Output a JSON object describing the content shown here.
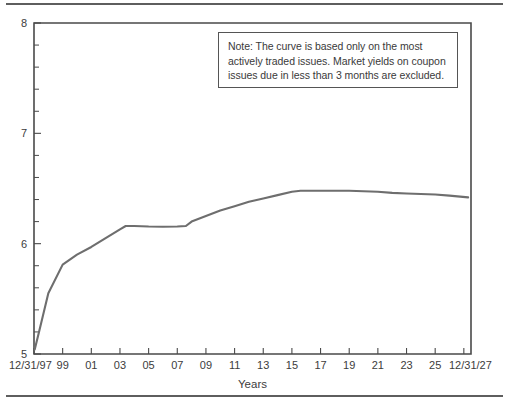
{
  "figure": {
    "note_text": "Note: The curve is based only on the most actively traded issues. Market yields on coupon issues due in less than 3 months are excluded."
  },
  "chart_data": {
    "type": "line",
    "title": "",
    "xlabel": "Years",
    "ylabel": "",
    "xlim": [
      1997,
      2027.5
    ],
    "ylim": [
      5,
      8
    ],
    "grid": false,
    "legend": null,
    "y_ticks": [
      5,
      6,
      7,
      8
    ],
    "y_tick_labels": [
      "5",
      "6",
      "7",
      "8"
    ],
    "y_minor_tick_step": 0.2,
    "x_ticks": [
      1997,
      1999,
      2001,
      2003,
      2005,
      2007,
      2009,
      2011,
      2013,
      2015,
      2017,
      2019,
      2021,
      2023,
      2025,
      2027
    ],
    "x_tick_labels": [
      "12/31/97",
      "99",
      "01",
      "03",
      "05",
      "07",
      "09",
      "11",
      "13",
      "15",
      "17",
      "19",
      "21",
      "23",
      "25",
      "12/31/27"
    ],
    "series": [
      {
        "name": "Treasury yield curve",
        "color": "#6e6e6e",
        "x": [
          1997.05,
          1997.35,
          1998.0,
          1999.0,
          2000.0,
          2001.0,
          2002.0,
          2003.0,
          2003.4,
          2004.0,
          2005.0,
          2006.0,
          2007.0,
          2007.6,
          2008.0,
          2009.0,
          2010.0,
          2011.0,
          2012.0,
          2013.0,
          2014.0,
          2015.0,
          2015.6,
          2016.0,
          2017.0,
          2018.0,
          2019.0,
          2020.0,
          2021.0,
          2022.0,
          2023.0,
          2024.0,
          2025.0,
          2026.0,
          2027.3
        ],
        "values": [
          5.04,
          5.2,
          5.55,
          5.81,
          5.9,
          5.97,
          6.05,
          6.13,
          6.16,
          6.16,
          6.155,
          6.153,
          6.155,
          6.16,
          6.2,
          6.25,
          6.3,
          6.34,
          6.38,
          6.41,
          6.44,
          6.47,
          6.48,
          6.48,
          6.48,
          6.48,
          6.48,
          6.475,
          6.47,
          6.46,
          6.455,
          6.45,
          6.445,
          6.435,
          6.42
        ]
      }
    ]
  }
}
